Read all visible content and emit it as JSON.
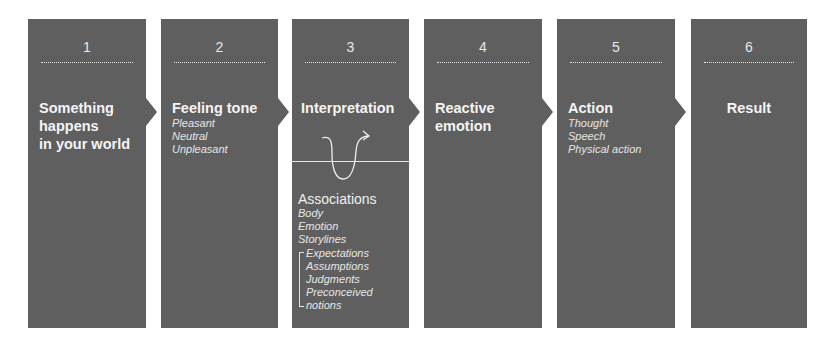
{
  "diagram": {
    "panel_color": "#5f5f5f",
    "steps": [
      {
        "number": "1",
        "title_lines": [
          "Something",
          "happens",
          "in your world"
        ],
        "items": []
      },
      {
        "number": "2",
        "title_lines": [
          "Feeling tone"
        ],
        "items": [
          "Pleasant",
          "Neutral",
          "Unpleasant"
        ]
      },
      {
        "number": "3",
        "title_lines": [
          "Interpretation"
        ],
        "items": [],
        "associations": {
          "title": "Associations",
          "items": [
            "Body",
            "Emotion",
            "Storylines"
          ],
          "bracketed": [
            "Expectations",
            "Assumptions",
            "Judgments",
            "Preconceived",
            "notions"
          ]
        }
      },
      {
        "number": "4",
        "title_lines": [
          "Reactive",
          "emotion"
        ],
        "items": []
      },
      {
        "number": "5",
        "title_lines": [
          "Action"
        ],
        "items": [
          "Thought",
          "Speech",
          "Physical action"
        ]
      },
      {
        "number": "6",
        "title_lines": [
          "Result"
        ],
        "items": []
      }
    ]
  }
}
